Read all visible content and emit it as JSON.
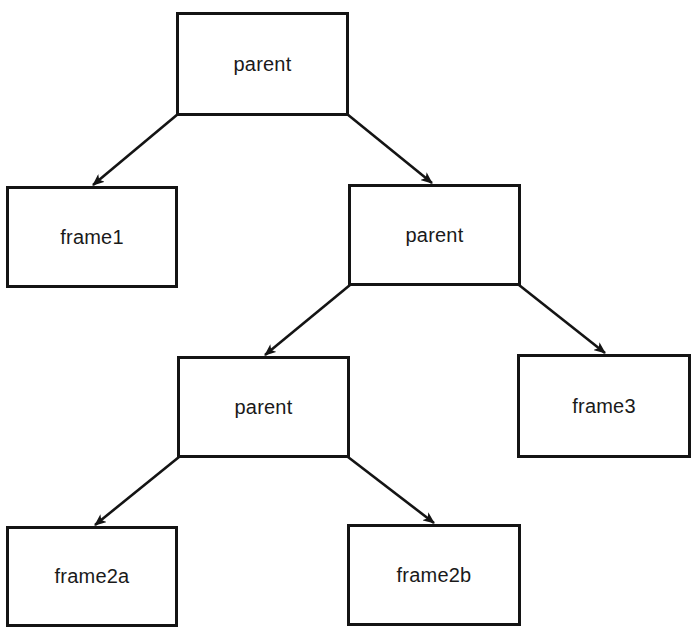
{
  "diagram": {
    "type": "tree",
    "stroke_color": "#141414",
    "background": "#ffffff",
    "nodes": [
      {
        "id": "root",
        "label": "parent",
        "x": 176,
        "y": 12,
        "w": 173,
        "h": 104
      },
      {
        "id": "frame1",
        "label": "frame1",
        "x": 6,
        "y": 186,
        "w": 172,
        "h": 102
      },
      {
        "id": "parent2",
        "label": "parent",
        "x": 348,
        "y": 184,
        "w": 173,
        "h": 102
      },
      {
        "id": "parent3",
        "label": "parent",
        "x": 177,
        "y": 356,
        "w": 173,
        "h": 102
      },
      {
        "id": "frame3",
        "label": "frame3",
        "x": 517,
        "y": 354,
        "w": 174,
        "h": 104
      },
      {
        "id": "frame2a",
        "label": "frame2a",
        "x": 6,
        "y": 526,
        "w": 172,
        "h": 101
      },
      {
        "id": "frame2b",
        "label": "frame2b",
        "x": 347,
        "y": 524,
        "w": 174,
        "h": 102
      }
    ],
    "edges": [
      {
        "from": "root",
        "to": "frame1",
        "x1": 178,
        "y1": 114,
        "x2": 93,
        "y2": 185
      },
      {
        "from": "root",
        "to": "parent2",
        "x1": 347,
        "y1": 114,
        "x2": 432,
        "y2": 183
      },
      {
        "from": "parent2",
        "to": "parent3",
        "x1": 350,
        "y1": 285,
        "x2": 265,
        "y2": 355
      },
      {
        "from": "parent2",
        "to": "frame3",
        "x1": 519,
        "y1": 285,
        "x2": 605,
        "y2": 353
      },
      {
        "from": "parent3",
        "to": "frame2a",
        "x1": 179,
        "y1": 457,
        "x2": 95,
        "y2": 525
      },
      {
        "from": "parent3",
        "to": "frame2b",
        "x1": 348,
        "y1": 457,
        "x2": 434,
        "y2": 523
      }
    ]
  }
}
